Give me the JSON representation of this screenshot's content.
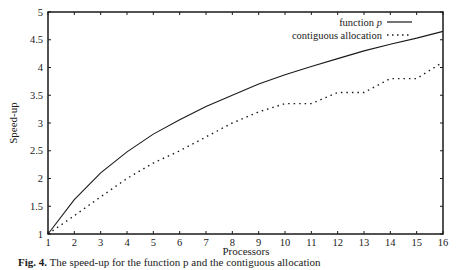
{
  "chart_data": {
    "type": "line",
    "title": "",
    "xlabel": "Processors",
    "ylabel": "Speed-up",
    "xlim": [
      1,
      16
    ],
    "ylim": [
      1,
      5
    ],
    "grid": false,
    "legend_position": "top-right",
    "x": [
      1,
      2,
      3,
      4,
      5,
      6,
      7,
      8,
      9,
      10,
      11,
      12,
      13,
      14,
      15,
      16
    ],
    "x_ticks": [
      "1",
      "2",
      "3",
      "4",
      "5",
      "6",
      "7",
      "8",
      "9",
      "10",
      "11",
      "12",
      "13",
      "14",
      "15",
      "16"
    ],
    "y_ticks": [
      "1",
      "1.5",
      "2",
      "2.5",
      "3",
      "3.5",
      "4",
      "4.5",
      "5"
    ],
    "series": [
      {
        "name": "function p",
        "style": "solid",
        "values": [
          1.0,
          1.62,
          2.1,
          2.48,
          2.8,
          3.06,
          3.3,
          3.5,
          3.7,
          3.87,
          4.02,
          4.16,
          4.3,
          4.42,
          4.53,
          4.65
        ]
      },
      {
        "name": "contiguous allocation",
        "style": "dotted",
        "values": [
          1.0,
          1.33,
          1.67,
          2.0,
          2.28,
          2.5,
          2.75,
          3.0,
          3.2,
          3.35,
          3.35,
          3.55,
          3.55,
          3.8,
          3.8,
          4.1
        ]
      }
    ]
  },
  "legend": {
    "series_1_name": "function ",
    "series_1_italic": "p",
    "series_2_name": "contiguous allocation"
  },
  "caption": {
    "label": "Fig. 4.",
    "text": "The speed-up for the function p and the contiguous allocation"
  },
  "colors": {
    "line": "#1a1a1a",
    "background": "#ffffff"
  }
}
